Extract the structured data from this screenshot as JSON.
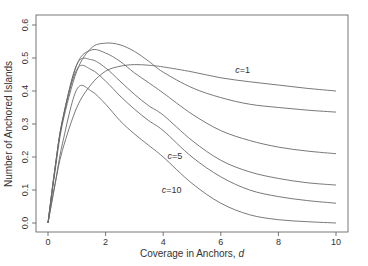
{
  "chart_data": {
    "type": "line",
    "title": "",
    "xlabel": "Coverage in Anchors, d",
    "xlabel_main": "Coverage in Anchors, ",
    "xlabel_var": "d",
    "ylabel": "Number of Anchored Islands",
    "xlim": [
      0,
      10
    ],
    "ylim": [
      0,
      0.6
    ],
    "xticks": [
      0,
      2,
      4,
      6,
      8,
      10
    ],
    "xtick_labels": [
      "0",
      "2",
      "4",
      "6",
      "8",
      "10"
    ],
    "yticks": [
      0.0,
      0.1,
      0.2,
      0.3,
      0.4,
      0.5,
      0.6
    ],
    "ytick_labels": [
      "0.0",
      "0.1",
      "0.2",
      "0.3",
      "0.4",
      "0.5",
      "0.6"
    ],
    "grid": false,
    "legend": "none (inline curve labels)",
    "series": [
      {
        "name": "c=1",
        "x": [
          0,
          0.25,
          0.5,
          1,
          1.5,
          2,
          2.5,
          3,
          3.5,
          4,
          5,
          6,
          7,
          8,
          9,
          10
        ],
        "values": [
          0,
          0.12,
          0.22,
          0.35,
          0.42,
          0.46,
          0.475,
          0.48,
          0.478,
          0.473,
          0.458,
          0.44,
          0.428,
          0.418,
          0.408,
          0.4
        ]
      },
      {
        "name": "c=2",
        "x": [
          0,
          0.25,
          0.5,
          1,
          1.5,
          2,
          2.5,
          3,
          3.5,
          4,
          5,
          6,
          7,
          8,
          9,
          10
        ],
        "values": [
          0,
          0.16,
          0.3,
          0.46,
          0.53,
          0.545,
          0.54,
          0.52,
          0.49,
          0.457,
          0.41,
          0.38,
          0.36,
          0.35,
          0.342,
          0.336
        ]
      },
      {
        "name": "c=3",
        "x": [
          0,
          0.25,
          0.5,
          1,
          1.5,
          2,
          2.5,
          3,
          3.5,
          4,
          5,
          6,
          7,
          8,
          9,
          10
        ],
        "values": [
          0,
          0.17,
          0.31,
          0.48,
          0.524,
          0.515,
          0.49,
          0.455,
          0.425,
          0.394,
          0.33,
          0.28,
          0.25,
          0.23,
          0.218,
          0.21
        ]
      },
      {
        "name": "c=5",
        "x": [
          0,
          0.25,
          0.5,
          1,
          1.5,
          2,
          2.5,
          3,
          3.5,
          4,
          5,
          6,
          7,
          8,
          9,
          10
        ],
        "values": [
          0,
          0.17,
          0.31,
          0.48,
          0.495,
          0.47,
          0.43,
          0.39,
          0.355,
          0.327,
          0.25,
          0.19,
          0.155,
          0.135,
          0.122,
          0.115
        ]
      },
      {
        "name": "c=7",
        "x": [
          0,
          0.25,
          0.5,
          1,
          1.5,
          2,
          2.5,
          3,
          3.5,
          4,
          5,
          6,
          7,
          8,
          9,
          10
        ],
        "values": [
          0,
          0.17,
          0.31,
          0.465,
          0.465,
          0.43,
          0.385,
          0.345,
          0.31,
          0.28,
          0.2,
          0.14,
          0.1,
          0.08,
          0.068,
          0.06
        ]
      },
      {
        "name": "c=10",
        "x": [
          0,
          0.25,
          0.5,
          1,
          1.5,
          2,
          2.5,
          3,
          3.5,
          4,
          5,
          6,
          7,
          8,
          9,
          10
        ],
        "values": [
          0,
          0.12,
          0.24,
          0.405,
          0.4,
          0.36,
          0.31,
          0.27,
          0.235,
          0.2,
          0.12,
          0.06,
          0.025,
          0.01,
          0.004,
          0.0
        ]
      }
    ],
    "annotations": [
      {
        "text": "c=1",
        "x": 6.5,
        "y": 0.455
      },
      {
        "text": "c=5",
        "x": 4.15,
        "y": 0.195
      },
      {
        "text": "c=10",
        "x": 3.95,
        "y": 0.09
      }
    ],
    "colors": {
      "line": "#6a6a6a",
      "axis": "#555555",
      "text": "#333333"
    }
  }
}
